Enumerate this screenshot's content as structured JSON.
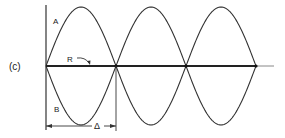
{
  "figure": {
    "panel_label": "(c)",
    "curve_a_label": "A",
    "curve_b_label": "B",
    "reference_label": "R",
    "spacing_label": "Δ",
    "cycles": 3
  },
  "colors": {
    "line": "#333333",
    "axis_tail": "#888888"
  }
}
